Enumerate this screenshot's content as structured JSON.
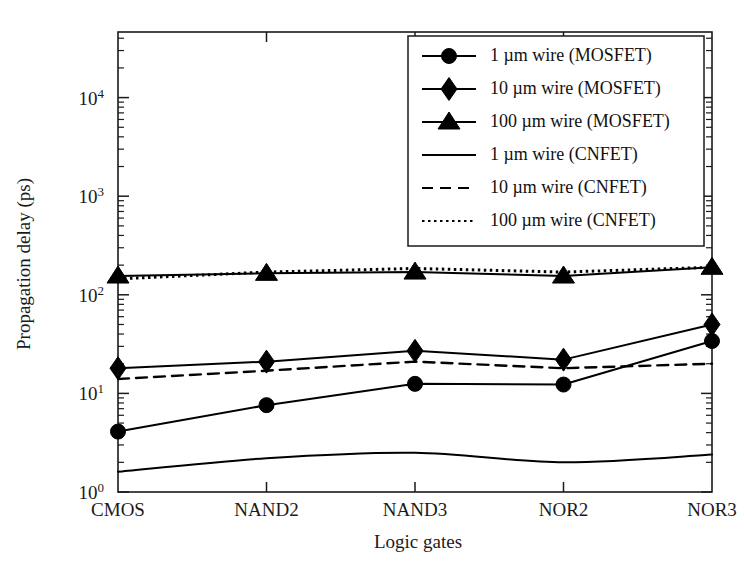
{
  "chart_data": {
    "type": "line",
    "title": "",
    "xlabel": "Logic gates",
    "ylabel": "Propagation delay (ps)",
    "categories": [
      "CMOS",
      "NAND2",
      "NAND3",
      "NOR2",
      "NOR3"
    ],
    "yscale": "log",
    "ylim": [
      1,
      50000
    ],
    "ytick_labels": [
      "10^0",
      "10^1",
      "10^2",
      "10^3",
      "10^4"
    ],
    "ytick_values": [
      1,
      10,
      100,
      1000,
      10000
    ],
    "grid": false,
    "legend_position": "top-right",
    "series": [
      {
        "name": "1 µm wire (MOSFET)",
        "marker": "circle",
        "style": "solid",
        "values": [
          4.1,
          7.6,
          12.5,
          12.3,
          34
        ]
      },
      {
        "name": "10 µm wire (MOSFET)",
        "marker": "diamond",
        "style": "solid",
        "values": [
          18,
          21,
          27,
          22,
          50
        ]
      },
      {
        "name": "100 µm wire (MOSFET)",
        "marker": "triangle",
        "style": "solid",
        "values": [
          155,
          165,
          170,
          155,
          190
        ]
      },
      {
        "name": "1 µm wire (CNFET)",
        "marker": "none",
        "style": "solid",
        "values": [
          1.6,
          2.2,
          2.5,
          2.0,
          2.4
        ]
      },
      {
        "name": "10 µm wire (CNFET)",
        "marker": "none",
        "style": "dashed",
        "values": [
          14,
          17,
          21,
          18,
          20
        ]
      },
      {
        "name": "100 µm wire (CNFET)",
        "marker": "none",
        "style": "dotted",
        "values": [
          145,
          170,
          185,
          170,
          190
        ]
      }
    ]
  },
  "colors": {
    "ink": "#000000",
    "axis": "#1a1a1a",
    "background": "#ffffff"
  }
}
